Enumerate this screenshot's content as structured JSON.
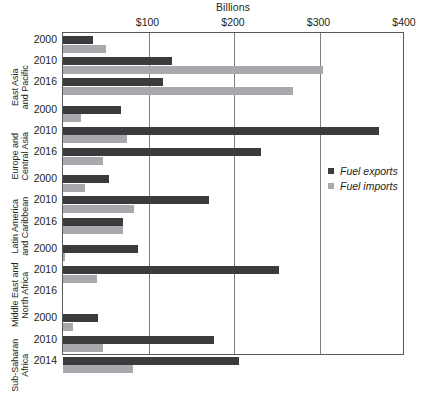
{
  "chart_data": {
    "type": "bar",
    "orientation": "horizontal",
    "title": "Billions",
    "xlabel": "",
    "ylabel": "",
    "xlim": [
      0,
      400
    ],
    "xticks": [
      100,
      200,
      300,
      400
    ],
    "xtick_labels": [
      "$100",
      "$200",
      "$300",
      "$400"
    ],
    "grid": true,
    "legend_position": "center-right",
    "series": [
      {
        "name": "Fuel exports",
        "color": "#3b3b3d"
      },
      {
        "name": "Fuel imports",
        "color": "#a7a9ac"
      }
    ],
    "groups": [
      {
        "region": "East Asia and Pacific",
        "rows": [
          {
            "year": "2000",
            "exports": 35,
            "imports": 50
          },
          {
            "year": "2010",
            "exports": 128,
            "imports": 304
          },
          {
            "year": "2016",
            "exports": 117,
            "imports": 269
          }
        ]
      },
      {
        "region": "Europe and Central Asia",
        "rows": [
          {
            "year": "2000",
            "exports": 68,
            "imports": 21
          },
          {
            "year": "2010",
            "exports": 370,
            "imports": 75
          },
          {
            "year": "2016",
            "exports": 232,
            "imports": 47
          }
        ]
      },
      {
        "region": "Latin America and Caribbean",
        "rows": [
          {
            "year": "2000",
            "exports": 54,
            "imports": 26
          },
          {
            "year": "2010",
            "exports": 171,
            "imports": 83
          },
          {
            "year": "2016",
            "exports": 70,
            "imports": 70
          }
        ]
      },
      {
        "region": "Middle East and North Africa",
        "rows": [
          {
            "year": "2000",
            "exports": 88,
            "imports": 2
          },
          {
            "year": "2010",
            "exports": 253,
            "imports": 40
          },
          {
            "year": "2016",
            "exports": 0,
            "imports": 0
          }
        ]
      },
      {
        "region": "Sub-Saharan Africa",
        "rows": [
          {
            "year": "2000",
            "exports": 41,
            "imports": 12
          },
          {
            "year": "2010",
            "exports": 177,
            "imports": 47
          },
          {
            "year": "2014",
            "exports": 206,
            "imports": 82
          }
        ]
      }
    ]
  },
  "legend": {
    "items": [
      {
        "label": "Fuel exports",
        "key": "exports"
      },
      {
        "label": "Fuel imports",
        "key": "imports"
      }
    ]
  },
  "colors": {
    "exports": "#3b3b3d",
    "imports": "#a7a9ac",
    "axis": "#58595b",
    "grid": "#7d7e80",
    "text": "#231f20"
  }
}
